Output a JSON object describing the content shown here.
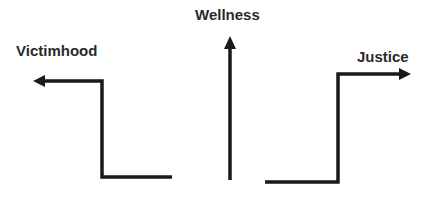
{
  "diagram": {
    "labels": {
      "victimhood": "Victimhood",
      "wellness": "Wellness",
      "justice": "Justice"
    },
    "colors": {
      "stroke": "#1a1a1a",
      "text": "#2a2a2a",
      "background": "#ffffff"
    },
    "paths": [
      {
        "name": "victimhood-path",
        "direction": "left",
        "points": [
          [
            172,
            177
          ],
          [
            102,
            177
          ],
          [
            102,
            81
          ],
          [
            40,
            81
          ]
        ]
      },
      {
        "name": "wellness-path",
        "direction": "up",
        "points": [
          [
            230,
            180
          ],
          [
            230,
            45
          ]
        ]
      },
      {
        "name": "justice-path",
        "direction": "right",
        "points": [
          [
            265,
            182
          ],
          [
            338,
            182
          ],
          [
            338,
            74
          ],
          [
            403,
            74
          ]
        ]
      }
    ]
  }
}
